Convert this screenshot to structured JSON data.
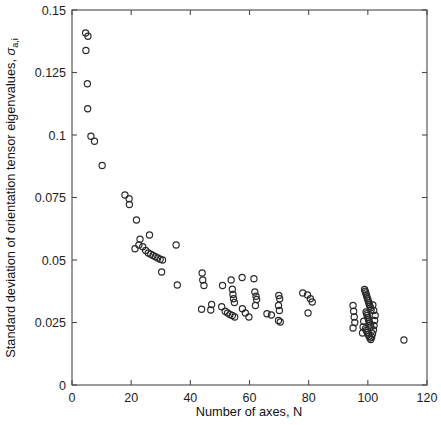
{
  "figure": {
    "type": "scatter-plot",
    "background": "#ffffff",
    "marker_style": "open-circle",
    "marker_color": "#2a2a2a"
  },
  "axes": {
    "x_title": "Number of axes, N",
    "y_title_main": "Standard deviation of orientation tensor eigenvalues, ",
    "y_title_symbol": "σ",
    "y_title_subscript": "a,i",
    "x_ticks": [
      "0",
      "20",
      "40",
      "60",
      "80",
      "100",
      "120"
    ],
    "y_ticks": [
      "0",
      "0.025",
      "0.05",
      "0.075",
      "0.1",
      "0.125",
      "0.15"
    ]
  },
  "chart_data": {
    "type": "scatter",
    "title": "",
    "xlabel": "Number of axes, N",
    "ylabel": "Standard deviation of orientation tensor eigenvalues, sigma_a,i",
    "xlim": [
      0,
      120
    ],
    "ylim": [
      0,
      0.15
    ],
    "xticks": [
      0,
      20,
      40,
      60,
      80,
      100,
      120
    ],
    "yticks": [
      0,
      0.025,
      0.05,
      0.075,
      0.1,
      0.125,
      0.15
    ],
    "grid": false,
    "legend": null,
    "series": [
      {
        "name": "orientation tensor eigenvalue scatter",
        "marker": "open-circle",
        "points": [
          [
            4.6,
            0.1408
          ],
          [
            5.4,
            0.1395
          ],
          [
            4.7,
            0.1338
          ],
          [
            5.2,
            0.1205
          ],
          [
            5.3,
            0.1105
          ],
          [
            6.4,
            0.0995
          ],
          [
            7.6,
            0.0975
          ],
          [
            10.2,
            0.0878
          ],
          [
            17.9,
            0.076
          ],
          [
            19.3,
            0.0745
          ],
          [
            19.4,
            0.0722
          ],
          [
            21.8,
            0.066
          ],
          [
            23.0,
            0.0583
          ],
          [
            26.2,
            0.06
          ],
          [
            21.3,
            0.0545
          ],
          [
            22.6,
            0.056
          ],
          [
            23.9,
            0.0553
          ],
          [
            24.9,
            0.0538
          ],
          [
            25.8,
            0.0528
          ],
          [
            26.6,
            0.0523
          ],
          [
            27.4,
            0.0518
          ],
          [
            28.2,
            0.0513
          ],
          [
            29.0,
            0.0508
          ],
          [
            29.8,
            0.0503
          ],
          [
            30.6,
            0.05
          ],
          [
            35.2,
            0.056
          ],
          [
            35.6,
            0.04
          ],
          [
            30.3,
            0.0452
          ],
          [
            44.0,
            0.0448
          ],
          [
            44.2,
            0.042
          ],
          [
            44.6,
            0.0398
          ],
          [
            47.2,
            0.0322
          ],
          [
            50.6,
            0.0313
          ],
          [
            43.8,
            0.0303
          ],
          [
            46.9,
            0.03
          ],
          [
            50.9,
            0.0398
          ],
          [
            53.8,
            0.042
          ],
          [
            54.2,
            0.0383
          ],
          [
            54.4,
            0.0362
          ],
          [
            54.6,
            0.0345
          ],
          [
            54.9,
            0.033
          ],
          [
            51.8,
            0.0295
          ],
          [
            52.6,
            0.0288
          ],
          [
            53.4,
            0.0282
          ],
          [
            54.2,
            0.0278
          ],
          [
            55.0,
            0.0272
          ],
          [
            57.6,
            0.0305
          ],
          [
            58.6,
            0.0288
          ],
          [
            59.8,
            0.0272
          ],
          [
            57.5,
            0.043
          ],
          [
            61.5,
            0.0425
          ],
          [
            61.8,
            0.0372
          ],
          [
            62.2,
            0.0355
          ],
          [
            62.4,
            0.0342
          ],
          [
            62.0,
            0.0318
          ],
          [
            65.9,
            0.0285
          ],
          [
            67.4,
            0.028
          ],
          [
            69.8,
            0.0318
          ],
          [
            70.1,
            0.0298
          ],
          [
            69.9,
            0.0358
          ],
          [
            70.2,
            0.0345
          ],
          [
            69.8,
            0.0258
          ],
          [
            70.4,
            0.0252
          ],
          [
            78.0,
            0.0368
          ],
          [
            79.6,
            0.036
          ],
          [
            80.6,
            0.0345
          ],
          [
            81.2,
            0.0332
          ],
          [
            79.8,
            0.0288
          ],
          [
            95.0,
            0.0318
          ],
          [
            95.2,
            0.0295
          ],
          [
            95.4,
            0.0272
          ],
          [
            95.6,
            0.025
          ],
          [
            95.0,
            0.0228
          ],
          [
            98.9,
            0.0382
          ],
          [
            99.1,
            0.0375
          ],
          [
            99.3,
            0.0368
          ],
          [
            99.5,
            0.036
          ],
          [
            99.7,
            0.0352
          ],
          [
            99.9,
            0.0345
          ],
          [
            100.1,
            0.0338
          ],
          [
            100.3,
            0.033
          ],
          [
            100.5,
            0.0322
          ],
          [
            100.7,
            0.0315
          ],
          [
            100.9,
            0.0308
          ],
          [
            101.1,
            0.03
          ],
          [
            99.4,
            0.0292
          ],
          [
            99.6,
            0.0285
          ],
          [
            99.8,
            0.0278
          ],
          [
            100.0,
            0.027
          ],
          [
            100.2,
            0.0262
          ],
          [
            100.4,
            0.0255
          ],
          [
            100.6,
            0.0248
          ],
          [
            100.8,
            0.024
          ],
          [
            101.0,
            0.0232
          ],
          [
            99.2,
            0.0225
          ],
          [
            99.5,
            0.0218
          ],
          [
            99.8,
            0.021
          ],
          [
            100.1,
            0.0202
          ],
          [
            100.4,
            0.0195
          ],
          [
            100.7,
            0.0188
          ],
          [
            101.0,
            0.0182
          ],
          [
            101.3,
            0.0192
          ],
          [
            101.6,
            0.0205
          ],
          [
            101.9,
            0.022
          ],
          [
            102.1,
            0.0238
          ],
          [
            102.3,
            0.0258
          ],
          [
            102.5,
            0.0278
          ],
          [
            102.0,
            0.0298
          ],
          [
            101.7,
            0.032
          ],
          [
            98.6,
            0.0255
          ],
          [
            98.4,
            0.0232
          ],
          [
            98.2,
            0.0208
          ],
          [
            112.2,
            0.018
          ]
        ]
      }
    ]
  }
}
